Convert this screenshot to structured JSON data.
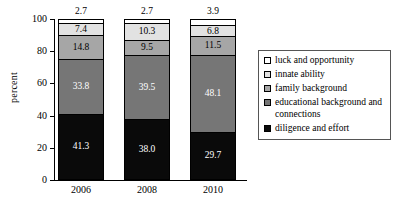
{
  "chart_data": {
    "type": "bar",
    "subtype": "stacked-vertical-100",
    "title": "",
    "xlabel": "",
    "ylabel": "percent",
    "ylim": [
      0,
      100
    ],
    "yticks": [
      "0",
      "20",
      "40",
      "60",
      "80",
      "100"
    ],
    "categories": [
      "2006",
      "2008",
      "2010"
    ],
    "grid": false,
    "legend_position": "right",
    "series": [
      {
        "name": "luck and opportunity",
        "color": "#ffffff",
        "label_color": "#000000",
        "values": [
          2.7,
          2.7,
          3.9
        ],
        "labels": [
          "2.7",
          "2.7",
          "3.9"
        ],
        "labels_outside": true
      },
      {
        "name": "innate ability",
        "color": "#e2e2e2",
        "label_color": "#000000",
        "values": [
          7.4,
          10.3,
          6.8
        ],
        "labels": [
          "7.4",
          "10.3",
          "6.8"
        ],
        "labels_outside": false
      },
      {
        "name": "family background",
        "color": "#a6a6a6",
        "label_color": "#000000",
        "values": [
          14.8,
          9.5,
          11.5
        ],
        "labels": [
          "14.8",
          "9.5",
          "11.5"
        ],
        "labels_outside": false
      },
      {
        "name": "educational background and connections",
        "color": "#767676",
        "label_color": "#ffffff",
        "values": [
          33.8,
          39.5,
          48.1
        ],
        "labels": [
          "33.8",
          "39.5",
          "48.1"
        ],
        "labels_outside": false
      },
      {
        "name": "diligence and effort",
        "color": "#0a0a0a",
        "label_color": "#ffffff",
        "values": [
          41.3,
          38.0,
          29.7
        ],
        "labels": [
          "41.3",
          "38.0",
          "29.7"
        ],
        "labels_outside": false
      }
    ]
  },
  "axis": {
    "y_title": "percent",
    "y_ticks": [
      "100",
      "80",
      "60",
      "40",
      "20",
      "0"
    ],
    "x_ticks": [
      "2006",
      "2008",
      "2010"
    ]
  },
  "legend": {
    "items": [
      {
        "label": "luck and opportunity",
        "swatch": "#ffffff"
      },
      {
        "label": "innate ability",
        "swatch": "#e2e2e2"
      },
      {
        "label": "family background",
        "swatch": "#a6a6a6"
      },
      {
        "label": "educational background and connections",
        "swatch": "#767676"
      },
      {
        "label": "diligence and effort",
        "swatch": "#0a0a0a"
      }
    ]
  },
  "top_values": [
    "2.7",
    "2.7",
    "3.9"
  ]
}
